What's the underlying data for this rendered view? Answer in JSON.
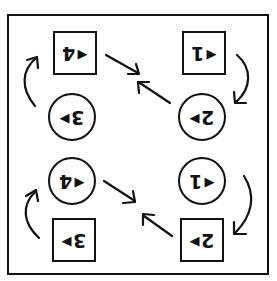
{
  "diagram": {
    "orientation_note": "labels appear rotated 180 degrees",
    "nodes": [
      {
        "id": "sq-top-left",
        "shape": "square",
        "digit": "4",
        "pointer": "▶",
        "pointer_side": "right"
      },
      {
        "id": "sq-top-right",
        "shape": "square",
        "digit": "1",
        "pointer": "▶",
        "pointer_side": "right"
      },
      {
        "id": "ci-upper-left",
        "shape": "circle",
        "digit": "3",
        "pointer": "◀",
        "pointer_side": "left"
      },
      {
        "id": "ci-upper-right",
        "shape": "circle",
        "digit": "2",
        "pointer": "◀",
        "pointer_side": "left"
      },
      {
        "id": "ci-lower-left",
        "shape": "circle",
        "digit": "4",
        "pointer": "▶",
        "pointer_side": "right"
      },
      {
        "id": "ci-lower-right",
        "shape": "circle",
        "digit": "1",
        "pointer": "▶",
        "pointer_side": "right"
      },
      {
        "id": "sq-bottom-left",
        "shape": "square",
        "digit": "3",
        "pointer": "◀",
        "pointer_side": "left"
      },
      {
        "id": "sq-bottom-right",
        "shape": "square",
        "digit": "2",
        "pointer": "◀",
        "pointer_side": "left"
      }
    ],
    "arrows": [
      {
        "from": "ci-upper-left",
        "to": "sq-top-left",
        "type": "curved"
      },
      {
        "from": "sq-top-left",
        "to": "center-top",
        "type": "straight"
      },
      {
        "from": "ci-upper-right",
        "to": "center-top",
        "type": "straight"
      },
      {
        "from": "sq-top-right",
        "to": "ci-upper-right",
        "type": "curved"
      },
      {
        "from": "sq-bottom-left",
        "to": "ci-lower-left",
        "type": "curved"
      },
      {
        "from": "ci-lower-left",
        "to": "center-bottom",
        "type": "straight"
      },
      {
        "from": "sq-bottom-right",
        "to": "center-bottom",
        "type": "straight"
      },
      {
        "from": "ci-lower-right",
        "to": "sq-bottom-right",
        "type": "curved"
      }
    ],
    "colors": {
      "stroke": "#111111",
      "background": "#ffffff"
    }
  }
}
